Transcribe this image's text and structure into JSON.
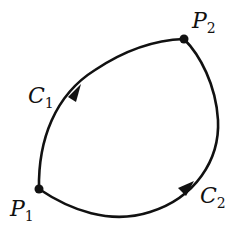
{
  "diagram": {
    "stroke_color": "#111111",
    "points": [
      {
        "id": "P1",
        "name": "P",
        "subscript": "1",
        "x": 39,
        "y": 189
      },
      {
        "id": "P2",
        "name": "P",
        "subscript": "2",
        "x": 184,
        "y": 39
      }
    ],
    "curves": [
      {
        "id": "C1",
        "name": "C",
        "subscript": "1",
        "from": "P1",
        "to": "P2",
        "direction": "P1 to P2"
      },
      {
        "id": "C2",
        "name": "C",
        "subscript": "2",
        "from": "P1",
        "to": "P2",
        "direction": "P1 to P2"
      }
    ],
    "labels": {
      "p1_main": "P",
      "p1_sub": "1",
      "p2_main": "P",
      "p2_sub": "2",
      "c1_main": "C",
      "c1_sub": "1",
      "c2_main": "C",
      "c2_sub": "2"
    }
  }
}
